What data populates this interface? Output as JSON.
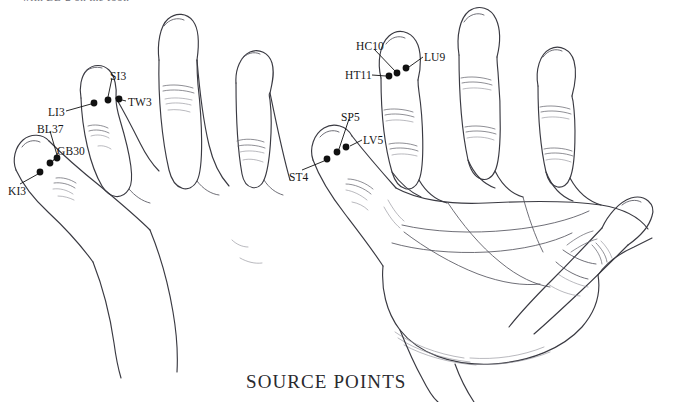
{
  "figure": {
    "caption": "SOURCE POINTS",
    "partial_top_text": "with BL-2 on the foot."
  },
  "ink_color": "#3a3a42",
  "dot_color": "#111111",
  "left_hand": {
    "name": "dorsal-hand-view",
    "points": [
      {
        "id": "SI3",
        "label": "SI3",
        "label_x": 110,
        "label_y": 71,
        "dot_x": 108,
        "dot_y": 100,
        "leader": [
          [
            112,
            78
          ],
          [
            108,
            97
          ]
        ]
      },
      {
        "id": "TW3",
        "label": "TW3",
        "label_x": 128,
        "label_y": 97,
        "dot_x": 119,
        "dot_y": 99,
        "leader": [
          [
            126,
            101
          ],
          [
            122,
            100
          ]
        ]
      },
      {
        "id": "LI3",
        "label": "LI3",
        "label_x": 48,
        "label_y": 107,
        "dot_x": 94,
        "dot_y": 103,
        "leader": [
          [
            66,
            111
          ],
          [
            91,
            104
          ]
        ]
      },
      {
        "id": "BL37",
        "label": "BL37",
        "label_x": 37,
        "label_y": 124,
        "dot_x": 57,
        "dot_y": 158,
        "leader": [
          [
            50,
            131
          ],
          [
            57,
            155
          ]
        ]
      },
      {
        "id": "GB30",
        "label": "GB30",
        "label_x": 57,
        "label_y": 146,
        "dot_x": 50,
        "dot_y": 163,
        "leader": [
          [
            58,
            153
          ],
          [
            53,
            161
          ]
        ]
      },
      {
        "id": "KI3",
        "label": "KI3",
        "label_x": 8,
        "label_y": 186,
        "dot_x": 40,
        "dot_y": 172,
        "leader": [
          [
            20,
            184
          ],
          [
            38,
            174
          ]
        ]
      }
    ]
  },
  "right_hand": {
    "name": "palmar-hand-view",
    "points": [
      {
        "id": "HC10",
        "label": "HC10",
        "label_x": 356,
        "label_y": 41,
        "dot_x": 397,
        "dot_y": 73,
        "leader": [
          [
            374,
            49
          ],
          [
            395,
            71
          ]
        ]
      },
      {
        "id": "LU9",
        "label": "LU9",
        "label_x": 424,
        "label_y": 52,
        "dot_x": 406,
        "dot_y": 68,
        "leader": [
          [
            423,
            57
          ],
          [
            409,
            67
          ]
        ]
      },
      {
        "id": "HT11",
        "label": "HT11",
        "label_x": 345,
        "label_y": 70,
        "dot_x": 389,
        "dot_y": 76,
        "leader": [
          [
            372,
            75
          ],
          [
            386,
            76
          ]
        ]
      },
      {
        "id": "SP5",
        "label": "SP5",
        "label_x": 341,
        "label_y": 112,
        "dot_x": 337,
        "dot_y": 152,
        "leader": [
          [
            349,
            119
          ],
          [
            339,
            149
          ]
        ]
      },
      {
        "id": "LV5",
        "label": "LV5",
        "label_x": 363,
        "label_y": 135,
        "dot_x": 346,
        "dot_y": 147,
        "leader": [
          [
            362,
            140
          ],
          [
            350,
            146
          ]
        ]
      },
      {
        "id": "ST4",
        "label": "ST4",
        "label_x": 289,
        "label_y": 172,
        "dot_x": 327,
        "dot_y": 159,
        "leader": [
          [
            302,
            170
          ],
          [
            324,
            161
          ]
        ]
      }
    ]
  }
}
